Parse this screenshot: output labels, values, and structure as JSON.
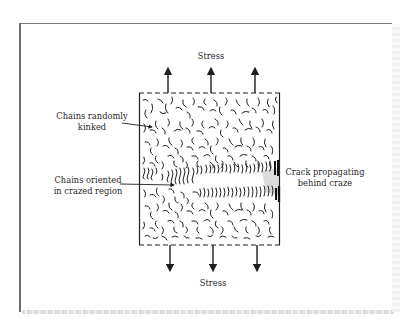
{
  "diagram": {
    "labels": {
      "stress_top": "Stress",
      "stress_bottom": "Stress",
      "chains_random_line1": "Chains randomly",
      "chains_random_line2": "kinked",
      "chains_oriented_line1": "Chains oriented",
      "chains_oriented_line2": "in crazed region",
      "crack_line1": "Crack propagating",
      "crack_line2": "behind craze"
    },
    "arrows": {
      "top_count": 3,
      "bottom_count": 3,
      "direction_top": "up",
      "direction_bottom": "down"
    },
    "colors": {
      "ink": "#1e1e1e",
      "frame": "#6e6e6e",
      "background": "#ffffff"
    }
  }
}
